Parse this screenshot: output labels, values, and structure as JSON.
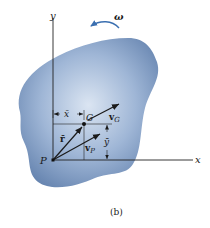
{
  "figure": {
    "caption": "(b)",
    "colors": {
      "body_fill_light": "#d4e0ef",
      "body_fill_dark": "#6f8fb8",
      "line": "#222222"
    },
    "axes": {
      "x_label": "x",
      "y_label": "y"
    },
    "angular_velocity": {
      "label": "ω"
    },
    "points": {
      "P": {
        "label": "P"
      },
      "G": {
        "label": "G"
      }
    },
    "vectors": {
      "r_bar": {
        "label": "r̄"
      },
      "v_G": {
        "label": "v",
        "sub": "G"
      },
      "v_P": {
        "label": "v",
        "sub": "P"
      }
    },
    "dimensions": {
      "x_bar": {
        "label": "x̄"
      },
      "y_bar": {
        "label": "ȳ"
      }
    }
  }
}
